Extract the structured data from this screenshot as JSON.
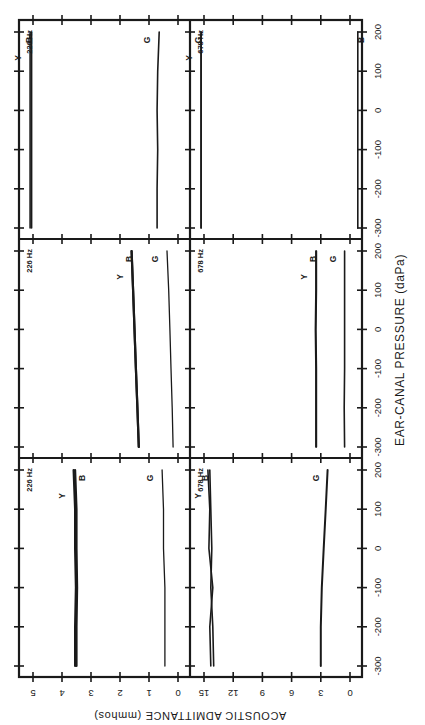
{
  "chart_data": {
    "type": "line",
    "orientation_note": "figure printed rotated 90 degrees counter-clockwise; pressure axis runs vertically in the image",
    "xlabel": "EAR-CANAL PRESSURE (daPa)",
    "ylabel": "ACOUSTIC ADMITTANCE (mmhos)",
    "x_ticks": [
      -300,
      -200,
      -100,
      0,
      100,
      200
    ],
    "x_range": [
      -300,
      200
    ],
    "panel_grid": {
      "rows": 3,
      "cols": 2
    },
    "columns": [
      {
        "frequency": "226 Hz",
        "y_ticks": [
          0,
          1,
          2,
          3,
          4,
          5
        ],
        "y_range": [
          0,
          5
        ]
      },
      {
        "frequency": "678 Hz",
        "y_ticks": [
          0,
          3,
          6,
          9,
          12,
          15
        ],
        "y_range": [
          0,
          15
        ]
      }
    ],
    "panels": [
      {
        "id": "p1-226",
        "column": 0,
        "row_from_left": 0,
        "freq_label": "226 Hz",
        "x": [
          -300,
          -200,
          -100,
          0,
          100,
          200
        ],
        "series": [
          {
            "name": "Y",
            "values": [
              3.55,
              3.55,
              3.52,
              3.55,
              3.55,
              3.6
            ],
            "width": 2.2
          },
          {
            "name": "B",
            "values": [
              3.5,
              3.5,
              3.48,
              3.5,
              3.5,
              3.55
            ],
            "width": 2.2
          },
          {
            "name": "G",
            "values": [
              0.45,
              0.45,
              0.45,
              0.5,
              0.5,
              0.55
            ],
            "width": 1.3
          }
        ],
        "labels": [
          {
            "text": "Y",
            "series": "Y"
          },
          {
            "text": "B",
            "series": "B"
          },
          {
            "text": "G",
            "series": "G"
          }
        ]
      },
      {
        "id": "p1-678",
        "column": 1,
        "row_from_left": 0,
        "freq_label": "678 Hz",
        "x": [
          -300,
          -200,
          -100,
          0,
          100,
          200
        ],
        "series": [
          {
            "name": "Y",
            "values": [
              14.0,
              14.1,
              14.3,
              14.2,
              14.3,
              14.4
            ],
            "width": 1.6
          },
          {
            "name": "B",
            "values": [
              14.3,
              14.4,
              14.1,
              14.5,
              14.4,
              14.6
            ],
            "width": 1.6
          },
          {
            "name": "G",
            "values": [
              3.0,
              3.0,
              2.9,
              2.7,
              2.5,
              2.3
            ],
            "width": 2.0
          }
        ],
        "labels": [
          {
            "text": "Y",
            "series": "Y"
          },
          {
            "text": "B",
            "series": "B"
          },
          {
            "text": "G",
            "series": "G"
          }
        ]
      },
      {
        "id": "p2-226",
        "column": 0,
        "row_from_left": 1,
        "freq_label": "226 Hz",
        "x": [
          -300,
          -200,
          -100,
          0,
          100,
          200
        ],
        "series": [
          {
            "name": "Y",
            "values": [
              1.35,
              1.4,
              1.45,
              1.5,
              1.55,
              1.6
            ],
            "width": 2.2
          },
          {
            "name": "B",
            "values": [
              1.35,
              1.4,
              1.45,
              1.5,
              1.55,
              1.6
            ],
            "width": 2.2
          },
          {
            "name": "G",
            "values": [
              0.17,
              0.2,
              0.24,
              0.28,
              0.32,
              0.38
            ],
            "width": 1.3
          }
        ],
        "labels": [
          {
            "text": "Y",
            "series": "Y"
          },
          {
            "text": "B",
            "series": "B"
          },
          {
            "text": "G",
            "series": "G"
          }
        ]
      },
      {
        "id": "p2-678",
        "column": 1,
        "row_from_left": 1,
        "freq_label": "678 Hz",
        "x": [
          -300,
          -200,
          -100,
          0,
          100,
          200
        ],
        "series": [
          {
            "name": "Y",
            "values": [
              3.5,
              3.5,
              3.5,
              3.55,
              3.5,
              3.5
            ],
            "width": 1.6
          },
          {
            "name": "B",
            "values": [
              3.45,
              3.45,
              3.45,
              3.5,
              3.45,
              3.45
            ],
            "width": 1.6
          },
          {
            "name": "G",
            "values": [
              0.55,
              0.6,
              0.55,
              0.55,
              0.55,
              0.55
            ],
            "width": 1.6
          }
        ],
        "labels": [
          {
            "text": "Y",
            "series": "Y"
          },
          {
            "text": "B",
            "series": "B"
          },
          {
            "text": "G",
            "series": "G"
          }
        ]
      },
      {
        "id": "p3-226",
        "column": 0,
        "row_from_left": 2,
        "freq_label": "226 Hz",
        "x": [
          -300,
          -200,
          -100,
          0,
          100,
          200
        ],
        "series": [
          {
            "name": "Y",
            "values": [
              5.1,
              5.1,
              5.1,
              5.1,
              5.1,
              5.1
            ],
            "width": 1.6,
            "note": "off scale (>5)"
          },
          {
            "name": "B",
            "values": [
              5.05,
              5.05,
              5.05,
              5.05,
              5.05,
              5.05
            ],
            "width": 1.6,
            "note": "off scale (>5)"
          },
          {
            "name": "G",
            "values": [
              0.72,
              0.72,
              0.7,
              0.72,
              0.7,
              0.65
            ],
            "width": 1.6
          }
        ],
        "labels": [
          {
            "text": "Y",
            "series": "Y"
          },
          {
            "text": "B",
            "series": "B"
          },
          {
            "text": "G",
            "series": "G"
          }
        ]
      },
      {
        "id": "p3-678",
        "column": 1,
        "row_from_left": 2,
        "freq_label": "678 Hz",
        "x": [
          -300,
          -200,
          -100,
          0,
          100,
          200
        ],
        "series": [
          {
            "name": "Y",
            "values": [
              15.3,
              15.3,
              15.3,
              15.3,
              15.3,
              15.3
            ],
            "width": 1.6,
            "note": "off scale (>15)"
          },
          {
            "name": "G",
            "values": [
              15.3,
              15.3,
              15.3,
              15.3,
              15.3,
              15.3
            ],
            "width": 1.6,
            "note": "off scale (>15)"
          },
          {
            "name": "B",
            "values": [
              -0.8,
              -0.8,
              -0.8,
              -0.8,
              -0.8,
              -0.8
            ],
            "width": 1.6,
            "note": "below zero"
          }
        ],
        "labels": [
          {
            "text": "Y",
            "series": "Y"
          },
          {
            "text": "G",
            "series": "G"
          },
          {
            "text": "B",
            "series": "B"
          }
        ]
      }
    ]
  },
  "axis_titles": {
    "pressure": "EAR-CANAL PRESSURE (daPa)",
    "admittance": "ACOUSTIC ADMITTANCE (mmhos)"
  }
}
